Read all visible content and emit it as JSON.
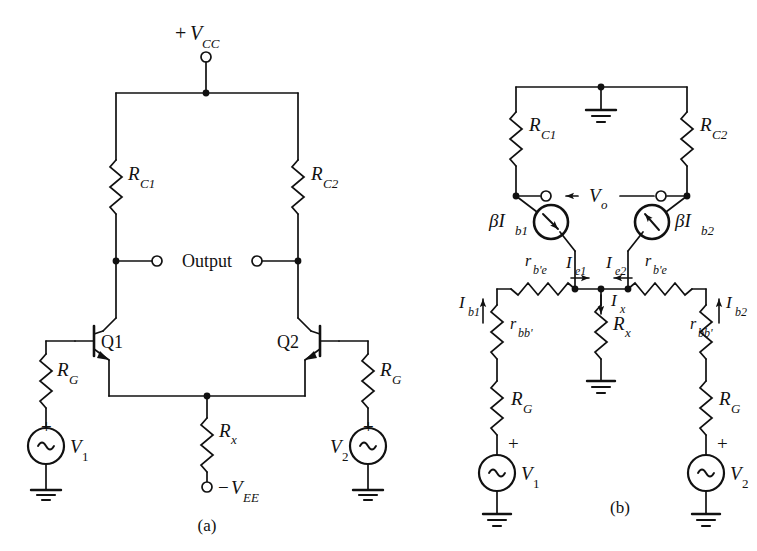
{
  "figure": {
    "kind": "circuit-schematic",
    "captions": [
      {
        "id": "a",
        "text": "(a)"
      },
      {
        "id": "b",
        "text": "(b)"
      }
    ]
  },
  "colors": {
    "line": "#111111",
    "background": "#ffffff",
    "text": "#111111"
  },
  "circuit_a": {
    "title": "Differential amplifier (full circuit)",
    "supply_top": {
      "label_plus": "+",
      "label_main": "V",
      "label_sub": "CC"
    },
    "supply_bottom": {
      "label_minus": "−",
      "label_main": "V",
      "label_sub": "EE"
    },
    "output_label": "Output",
    "resistors": [
      {
        "name": "R",
        "sub": "C1"
      },
      {
        "name": "R",
        "sub": "C2"
      },
      {
        "name": "R",
        "sub": "x"
      },
      {
        "name": "R",
        "sub": "G"
      },
      {
        "name": "R",
        "sub": "G"
      }
    ],
    "transistors": [
      {
        "label": "Q1"
      },
      {
        "label": "Q2"
      }
    ],
    "sources": [
      {
        "name": "V",
        "sub": "1",
        "polarity": "+"
      },
      {
        "name": "V",
        "sub": "2",
        "polarity": "+"
      }
    ]
  },
  "circuit_b": {
    "title": "Small-signal equivalent circuit",
    "output_label": {
      "name": "V",
      "sub": "o"
    },
    "resistors": [
      {
        "name": "R",
        "sub": "C1"
      },
      {
        "name": "R",
        "sub": "C2"
      },
      {
        "name": "r",
        "sub": "b'e"
      },
      {
        "name": "r",
        "sub": "b'e"
      },
      {
        "name": "r",
        "sub": "bb'"
      },
      {
        "name": "r",
        "sub": "bb'"
      },
      {
        "name": "R",
        "sub": "x"
      },
      {
        "name": "R",
        "sub": "G"
      },
      {
        "name": "R",
        "sub": "G"
      }
    ],
    "current_sources": [
      {
        "name": "βI",
        "sub": "b1",
        "arrow": "down-right"
      },
      {
        "name": "βI",
        "sub": "b2",
        "arrow": "up-left"
      }
    ],
    "currents": [
      {
        "name": "I",
        "sub": "e1",
        "arrow": "right"
      },
      {
        "name": "I",
        "sub": "e2",
        "arrow": "left"
      },
      {
        "name": "I",
        "sub": "x",
        "arrow": "down"
      },
      {
        "name": "I",
        "sub": "b1",
        "arrow": "up"
      },
      {
        "name": "I",
        "sub": "b2",
        "arrow": "up"
      }
    ],
    "sources": [
      {
        "name": "V",
        "sub": "1",
        "polarity": "+"
      },
      {
        "name": "V",
        "sub": "2",
        "polarity": "+"
      }
    ]
  }
}
